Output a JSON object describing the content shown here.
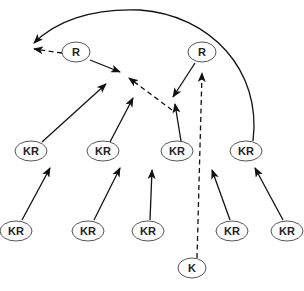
{
  "diagram": {
    "type": "directed-graph",
    "colors": {
      "stroke": "#111111",
      "node_border": "#555555",
      "background": "#ffffff"
    },
    "nodes": [
      {
        "id": "R1",
        "label": "R",
        "x": 76,
        "y": 52
      },
      {
        "id": "R2",
        "label": "R",
        "x": 202,
        "y": 52
      },
      {
        "id": "KR1",
        "label": "KR",
        "x": 31,
        "y": 151
      },
      {
        "id": "KR2",
        "label": "KR",
        "x": 103,
        "y": 151
      },
      {
        "id": "KR3",
        "label": "KR",
        "x": 177,
        "y": 151
      },
      {
        "id": "KR4",
        "label": "KR",
        "x": 246,
        "y": 151
      },
      {
        "id": "KR5",
        "label": "KR",
        "x": 16,
        "y": 231
      },
      {
        "id": "KR6",
        "label": "KR",
        "x": 88,
        "y": 231
      },
      {
        "id": "KR7",
        "label": "KR",
        "x": 148,
        "y": 231
      },
      {
        "id": "KR8",
        "label": "KR",
        "x": 232,
        "y": 231
      },
      {
        "id": "KR9",
        "label": "KR",
        "x": 287,
        "y": 231
      },
      {
        "id": "K",
        "label": "K",
        "x": 192,
        "y": 268
      }
    ],
    "edges": [
      {
        "from": "R1",
        "style": "dashed",
        "d": "M 62 53 L 34 49"
      },
      {
        "from": "R1",
        "style": "solid",
        "d": "M 90 60 L 120 72"
      },
      {
        "from": "KR1",
        "style": "solid",
        "d": "M 42 142 L 106 84"
      },
      {
        "from": "KR2",
        "style": "solid",
        "d": "M 110 142 L 133 98"
      },
      {
        "from": "KR3",
        "style": "dashed",
        "d": "M 172 110 L 129 78"
      },
      {
        "from": "R2",
        "style": "solid",
        "d": "M 195 63 L 173 97"
      },
      {
        "from": "KR3",
        "style": "solid",
        "d": "M 181 141 L 175 104"
      },
      {
        "from": "KR4",
        "style": "solid",
        "d": "M 253 141 C 262 70, 210 15, 140 10 C 90 8, 55 22, 34 43"
      },
      {
        "from": "K",
        "style": "dashed",
        "d": "M 197 258 L 202 73"
      },
      {
        "from": "KR5",
        "style": "solid",
        "d": "M 22 220 L 50 168"
      },
      {
        "from": "KR6",
        "style": "solid",
        "d": "M 94 220 L 120 168"
      },
      {
        "from": "KR7",
        "style": "solid",
        "d": "M 150 220 L 152 170"
      },
      {
        "from": "KR8",
        "style": "solid",
        "d": "M 230 220 L 212 170"
      },
      {
        "from": "KR9",
        "style": "solid",
        "d": "M 283 220 L 255 168"
      }
    ]
  }
}
